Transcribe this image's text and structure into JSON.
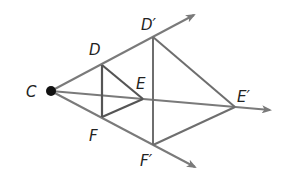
{
  "colors": {
    "ray": "#7a7a7a",
    "image_triangle": "#6e6e6e",
    "preimage_triangle": "#555555",
    "center_point": "#111111",
    "label": "#222222"
  },
  "points": {
    "C": {
      "label": "C",
      "x": 51,
      "y": 91
    },
    "D": {
      "label": "D",
      "x": 102,
      "y": 65
    },
    "E": {
      "label": "E",
      "x": 143,
      "y": 99
    },
    "F": {
      "label": "F",
      "x": 102,
      "y": 117
    },
    "D_prime": {
      "label": "D′",
      "x": 153,
      "y": 37
    },
    "E_prime": {
      "label": "E′",
      "x": 235,
      "y": 107
    },
    "F_prime": {
      "label": "F′",
      "x": 153,
      "y": 145
    }
  },
  "rays": [
    {
      "from": "C",
      "through": "D′",
      "tip": {
        "x": 196,
        "y": 14
      }
    },
    {
      "from": "C",
      "through": "E′",
      "tip": {
        "x": 272,
        "y": 110
      }
    },
    {
      "from": "C",
      "through": "F′",
      "tip": {
        "x": 197,
        "y": 168
      }
    }
  ],
  "labels": {
    "C": "C",
    "D": "D",
    "E": "E",
    "F": "F",
    "D_prime": "D′",
    "E_prime": "E′",
    "F_prime": "F′"
  }
}
